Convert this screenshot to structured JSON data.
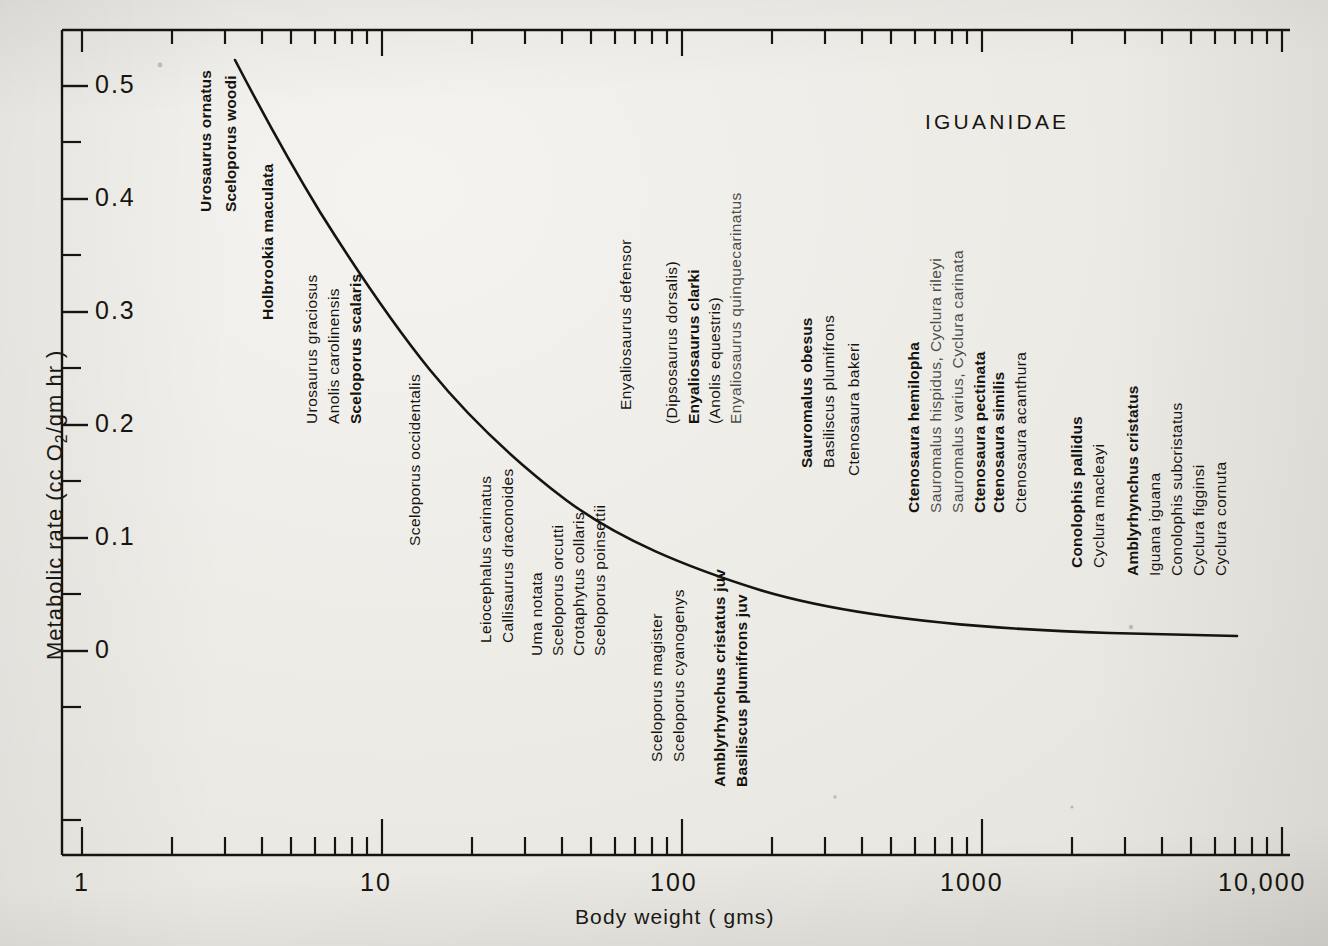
{
  "chart_data": {
    "type": "line",
    "title": "IGUANIDAE",
    "xlabel": "Body weight (gms)",
    "ylabel": "Metabolic rate (cc O2/gm hr)",
    "xscale": "log",
    "xlim": [
      1,
      10000
    ],
    "ylim": [
      -0.03,
      0.56
    ],
    "xticklabels": [
      "1",
      "10",
      "100",
      "1000",
      "10,000"
    ],
    "xtickvalues": [
      1,
      10,
      100,
      1000,
      10000
    ],
    "yticklabels": [
      "0",
      "0.1",
      "0.2",
      "0.3",
      "0.4",
      "0.5"
    ],
    "ytickvalues": [
      0,
      0.1,
      0.2,
      0.3,
      0.4,
      0.5
    ],
    "grid": false,
    "legend": false,
    "series": [
      {
        "name": "allometric metabolic rate curve",
        "x": [
          3.0,
          4.0,
          6.0,
          9.0,
          14.0,
          22.0,
          35.0,
          60.0,
          100.0,
          180.0,
          330.0,
          600.0,
          1200.0,
          2500.0,
          5000.0,
          9500.0
        ],
        "y": [
          0.535,
          0.455,
          0.372,
          0.31,
          0.262,
          0.222,
          0.19,
          0.16,
          0.138,
          0.118,
          0.101,
          0.087,
          0.074,
          0.063,
          0.055,
          0.048
        ]
      }
    ],
    "annotations": [
      "Urosaurus ornatus",
      "Sceloporus woodi",
      "Holbrookia maculata",
      "Urosaurus graciosus",
      "Anolis carolinensis",
      "Sceloporus scalaris",
      "Sceloporus occidentalis",
      "Leiocephalus carinatus",
      "Callisaurus draconoides",
      "Uma notata",
      "Sceloporus orcutti",
      "Crotaphytus collaris",
      "Sceloporus poinsettii",
      "Sceloporus magister",
      "Sceloporus cyanogenys",
      "Amblyrhynchus cristatus juv",
      "Basiliscus plumifrons juv",
      "Enyaliosaurus defensor",
      "(Dipsosaurus dorsalis)",
      "Enyaliosaurus clarki",
      "(Anolis equestris)",
      "Enyaliosaurus quinquecarinatus",
      "Sauromalus obesus",
      "Basiliscus plumifrons",
      "Ctenosaura bakeri",
      "Ctenosaura hemilopha",
      "Sauromalus hispidus, Cyclura rileyi",
      "Sauromalus varius, Cyclura carinata",
      "Ctenosaura pectinata",
      "Ctenosaura similis",
      "Ctenosaura acanthura",
      "Conolophis pallidus",
      "Cyclura macleayi",
      "Amblyrhynchus cristatus",
      "Iguana iguana",
      "Conolophis subcristatus",
      "Cyclura figginsi",
      "Cyclura cornuta"
    ]
  },
  "axes": {
    "y_title_prefix": "Metabolic rate (cc O",
    "y_title_sub": "2",
    "y_title_suffix": "/gm hr )",
    "x_title": "Body weight ( gms)",
    "family_title": "IGUANIDAE"
  },
  "yticks": [
    {
      "label": "0.5"
    },
    {
      "label": "0.4"
    },
    {
      "label": "0.3"
    },
    {
      "label": "0.2"
    },
    {
      "label": "0.1"
    },
    {
      "label": "0"
    }
  ],
  "xticks": [
    {
      "label": "1"
    },
    {
      "label": "10"
    },
    {
      "label": "100"
    },
    {
      "label": "1000"
    },
    {
      "label": "10,000"
    }
  ],
  "species_labels": [
    {
      "text": "Urosaurus ornatus",
      "x": 197,
      "y": 212,
      "bold": true,
      "gray": false
    },
    {
      "text": "Sceloporus woodi",
      "x": 222,
      "y": 212,
      "bold": true,
      "gray": false
    },
    {
      "text": "Holbrookia maculata",
      "x": 259,
      "y": 320,
      "bold": true,
      "gray": false
    },
    {
      "text": "Urosaurus graciosus",
      "x": 303,
      "y": 424,
      "bold": false,
      "gray": false
    },
    {
      "text": "Anolis carolinensis",
      "x": 325,
      "y": 424,
      "bold": false,
      "gray": false
    },
    {
      "text": "Sceloporus scalaris",
      "x": 347,
      "y": 424,
      "bold": true,
      "gray": false
    },
    {
      "text": "Sceloporus occidentalis",
      "x": 406,
      "y": 546,
      "bold": false,
      "gray": false
    },
    {
      "text": "Leiocephalus carinatus",
      "x": 477,
      "y": 643,
      "bold": false,
      "gray": false
    },
    {
      "text": "Callisaurus draconoides",
      "x": 499,
      "y": 643,
      "bold": false,
      "gray": false
    },
    {
      "text": "Uma notata",
      "x": 528,
      "y": 656,
      "bold": false,
      "gray": false
    },
    {
      "text": "Sceloporus orcutti",
      "x": 549,
      "y": 656,
      "bold": false,
      "gray": false
    },
    {
      "text": "Crotaphytus collaris",
      "x": 570,
      "y": 656,
      "bold": false,
      "gray": false
    },
    {
      "text": "Sceloporus poinsettii",
      "x": 591,
      "y": 656,
      "bold": false,
      "gray": false
    },
    {
      "text": "Sceloporus magister",
      "x": 648,
      "y": 762,
      "bold": false,
      "gray": false
    },
    {
      "text": "Sceloporus cyanogenys",
      "x": 670,
      "y": 762,
      "bold": false,
      "gray": false
    },
    {
      "text": "Amblyrhynchus cristatus juv",
      "x": 711,
      "y": 787,
      "bold": true,
      "gray": false
    },
    {
      "text": "Basiliscus plumifrons juv",
      "x": 733,
      "y": 787,
      "bold": true,
      "gray": false
    },
    {
      "text": "Enyaliosaurus defensor",
      "x": 617,
      "y": 410,
      "bold": false,
      "gray": false
    },
    {
      "text": "(Dipsosaurus dorsalis)",
      "x": 663,
      "y": 424,
      "bold": false,
      "gray": false
    },
    {
      "text": "Enyaliosaurus clarki",
      "x": 685,
      "y": 424,
      "bold": true,
      "gray": false
    },
    {
      "text": "(Anolis equestris)",
      "x": 706,
      "y": 424,
      "bold": false,
      "gray": false
    },
    {
      "text": "Enyaliosaurus quinquecarinatus",
      "x": 727,
      "y": 424,
      "bold": false,
      "gray": true
    },
    {
      "text": "Sauromalus obesus",
      "x": 798,
      "y": 468,
      "bold": true,
      "gray": false
    },
    {
      "text": "Basiliscus plumifrons",
      "x": 820,
      "y": 468,
      "bold": false,
      "gray": false
    },
    {
      "text": "Ctenosaura bakeri",
      "x": 845,
      "y": 476,
      "bold": false,
      "gray": false
    },
    {
      "text": "Ctenosaura hemilopha",
      "x": 905,
      "y": 513,
      "bold": true,
      "gray": false
    },
    {
      "text": "Sauromalus hispidus, Cyclura rileyi",
      "x": 927,
      "y": 513,
      "bold": false,
      "gray": true
    },
    {
      "text": "Sauromalus varius, Cyclura carinata",
      "x": 949,
      "y": 513,
      "bold": false,
      "gray": true
    },
    {
      "text": "Ctenosaura pectinata",
      "x": 971,
      "y": 513,
      "bold": true,
      "gray": false
    },
    {
      "text": "Ctenosaura similis",
      "x": 990,
      "y": 513,
      "bold": true,
      "gray": false
    },
    {
      "text": "Ctenosaura acanthura",
      "x": 1012,
      "y": 513,
      "bold": false,
      "gray": false
    },
    {
      "text": "Conolophis pallidus",
      "x": 1068,
      "y": 568,
      "bold": true,
      "gray": false
    },
    {
      "text": "Cyclura macleayi",
      "x": 1090,
      "y": 568,
      "bold": false,
      "gray": false
    },
    {
      "text": "Amblyrhynchus cristatus",
      "x": 1124,
      "y": 576,
      "bold": true,
      "gray": false
    },
    {
      "text": "Iguana iguana",
      "x": 1146,
      "y": 576,
      "bold": false,
      "gray": false
    },
    {
      "text": "Conolophis subcristatus",
      "x": 1168,
      "y": 576,
      "bold": false,
      "gray": false
    },
    {
      "text": "Cyclura figginsi",
      "x": 1190,
      "y": 576,
      "bold": false,
      "gray": false
    },
    {
      "text": "Cyclura cornuta",
      "x": 1212,
      "y": 576,
      "bold": false,
      "gray": false
    }
  ]
}
